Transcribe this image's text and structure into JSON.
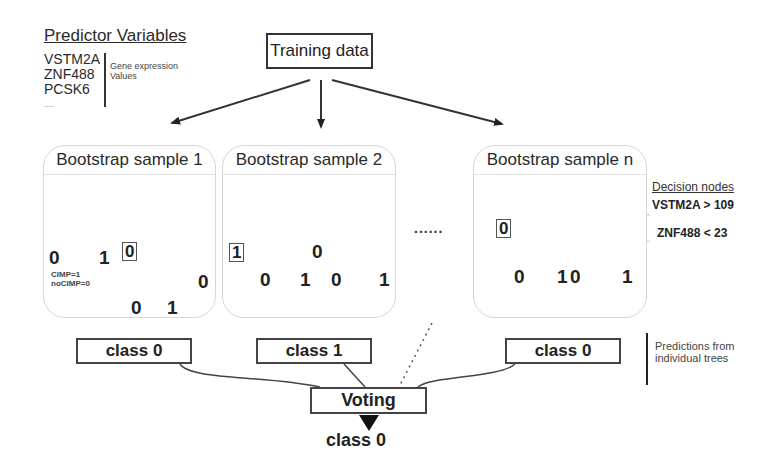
{
  "predictor_variables": {
    "title": "Predictor Variables",
    "genes": [
      "VSTM2A",
      "ZNF488",
      "PCSK6",
      "...."
    ],
    "note_line1": "Gene expression",
    "note_line2": "Values"
  },
  "training_data": {
    "label": "Training data"
  },
  "bootstrap_samples": [
    {
      "title": "Bootstrap sample 1",
      "leaves": [
        "0",
        "1",
        "0",
        "0",
        "0",
        "1"
      ],
      "boxed_leaf": "0",
      "legend_line1": "CIMP=1",
      "legend_line2": "noCIMP=0",
      "prediction": "class 0"
    },
    {
      "title": "Bootstrap sample 2",
      "leaves": [
        "1",
        "0",
        "1",
        "0",
        "0",
        "1"
      ],
      "boxed_leaf": "1",
      "prediction": "class 1"
    },
    {
      "title": "Bootstrap sample n",
      "leaves": [
        "0",
        "0",
        "1",
        "0",
        "1"
      ],
      "boxed_leaf": "0",
      "prediction": "class 0"
    }
  ],
  "ellipsis": "......",
  "decision_nodes": {
    "title": "Decision nodes",
    "nodes": [
      "VSTM2A > 109",
      "ZNF488 < 23"
    ]
  },
  "predictions_note": {
    "line1": "Predictions from",
    "line2": "individual trees"
  },
  "voting": {
    "label": "Voting",
    "result": "class 0"
  }
}
